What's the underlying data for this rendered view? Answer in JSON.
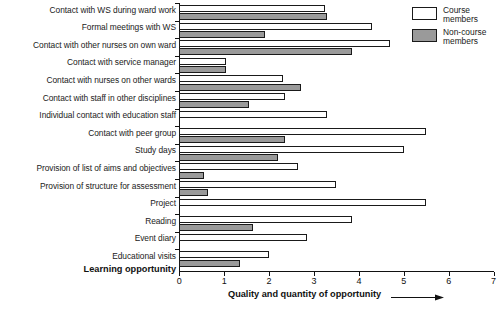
{
  "chart_data": {
    "type": "bar",
    "orientation": "horizontal",
    "title": "",
    "xlabel": "Quality and quantity of opportunity",
    "ylabel": "Learning opportunity",
    "xlim": [
      0,
      7
    ],
    "xticks": [
      0,
      1,
      2,
      3,
      4,
      5,
      6,
      7
    ],
    "xtick_labels": [
      "0",
      "1",
      "2",
      "3",
      "4",
      "5",
      "6",
      "7"
    ],
    "grid": false,
    "legend_position": "top-right",
    "categories": [
      "Contact with WS during ward work",
      "Formal meetings with WS",
      "Contact with other nurses on own ward",
      "Contact with service manager",
      "Contact with nurses on other wards",
      "Contact with staff in other disciplines",
      "Individual contact with education staff",
      "Contact with peer group",
      "Study days",
      "Provision of list of aims and objectives",
      "Provision of structure for assessment",
      "Project",
      "Reading",
      "Event diary",
      "Educational visits"
    ],
    "series": [
      {
        "name": "Course members",
        "color": "#ffffff",
        "values": [
          3.25,
          4.3,
          4.7,
          1.03,
          2.3,
          2.35,
          3.3,
          5.5,
          5.0,
          2.65,
          3.5,
          5.5,
          3.85,
          2.85,
          2.0
        ]
      },
      {
        "name": "Non-course members",
        "color": "#9a9a9a",
        "values": [
          3.3,
          1.9,
          3.85,
          1.03,
          2.7,
          1.55,
          null,
          2.35,
          2.2,
          0.55,
          0.65,
          null,
          1.65,
          null,
          1.35
        ]
      }
    ]
  },
  "legend": {
    "items": [
      {
        "label_line1": "Course",
        "label_line2": "members",
        "swatch": "course-swatch"
      },
      {
        "label_line1": "Non-course",
        "label_line2": "members",
        "swatch": "noncourse-swatch"
      }
    ]
  },
  "axis_titles": {
    "y": "Learning opportunity",
    "x": "Quality and quantity of opportunity"
  },
  "colors": {
    "course_members": "#ffffff",
    "non_course_members": "#9a9a9a",
    "axis": "#111111",
    "background": "#ffffff"
  }
}
